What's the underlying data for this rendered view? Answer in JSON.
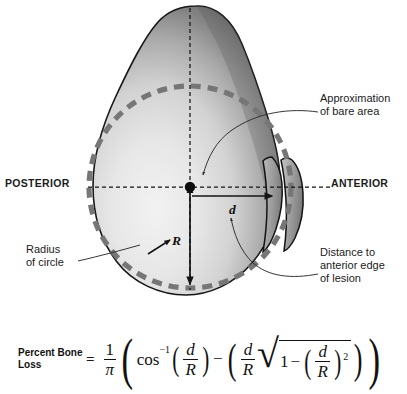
{
  "figure": {
    "title_absent": true,
    "background_color": "#ffffff",
    "ink_color": "#1a1a1a"
  },
  "anatomy_labels": {
    "posterior": "POSTERIOR",
    "anterior": "ANTERIOR"
  },
  "callouts": {
    "approximation": "Approximation\nof bare area",
    "radius": "Radius\nof circle",
    "distance": "Distance to\nanterior edge\nof lesion"
  },
  "dimension_labels": {
    "radius_symbol": "R",
    "distance_symbol": "d"
  },
  "formula": {
    "name": "Percent Bone\nLoss",
    "equals": "=",
    "coefficient_numerator": "1",
    "coefficient_denominator": "π",
    "function": "cos",
    "function_exponent": "−1",
    "term1_numerator": "d",
    "term1_denominator": "R",
    "minus": "−",
    "term2_numerator": "d",
    "term2_denominator": "R",
    "sqrt_one": "1",
    "sqrt_minus": "−",
    "term3_numerator": "d",
    "term3_denominator": "R",
    "term3_exponent": "2",
    "plain_text": "Percent Bone Loss = (1/π)( cos⁻¹(d/R) − ( (d/R)√(1−(d/R)²) ) )"
  },
  "graphic_colors": {
    "bone_outline": "#1a1a1a",
    "bone_fill_light": "#ececec",
    "bone_fill_dark": "#5d5d5d",
    "dashed_circle": "#787878",
    "centerline": "#1a1a1a",
    "lesion_fill": "#8f8f8f",
    "leader_line": "#3a3a3a"
  },
  "graphic_parts": {
    "bone_shape": "pear-shaped proximal humerus head, superior view",
    "dashed_circle": "approximation of bare area circle",
    "lesion_fragment": "detached anterior bone fragment",
    "center_dot": "circle center point",
    "horizontal_axis": "posterior-anterior dashed axis",
    "vertical_axis": "dashed vertical axis with radius arrow",
    "d_arrow": "horizontal arrow from center to anterior edge of lesion",
    "r_arrow": "arrow pointing to circle radius"
  }
}
